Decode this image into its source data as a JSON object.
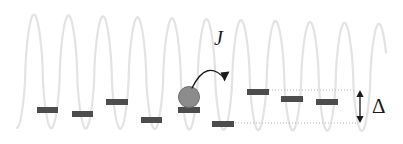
{
  "figure": {
    "background_color": "#ffffff",
    "width": 403,
    "height": 144
  },
  "annotations": {
    "coupling_label": "J",
    "offset_label": "Δ"
  },
  "colors": {
    "lattice_potential": "#e3e3e3",
    "energy_level": "#4d4d4d",
    "atom_fill": "#8c8c8c",
    "atom_stroke": "#6e6e6e",
    "guide_line": "#b5b5b5",
    "arrow": "#1a1a1a",
    "text": "#1a1a1a"
  },
  "chart_data": {
    "type": "line",
    "xlabel": "",
    "ylabel": "",
    "grid": false,
    "legend": null,
    "xlim": [
      0,
      403
    ],
    "ylim": [
      144,
      0
    ],
    "series": [
      {
        "name": "lattice potential",
        "type": "sinusoid",
        "color": "#e3e3e3",
        "stroke_width": 2.2,
        "amplitude_top_y": 14,
        "amplitude_bottom_y": 128,
        "period_px": 34.5,
        "first_peak_x": 34,
        "num_peaks": 10,
        "x_start": 17,
        "x_end": 386,
        "peak_x_values": [
          34,
          68.5,
          103,
          137.5,
          172,
          206.5,
          241,
          275.5,
          310,
          344.5
        ],
        "trough_x_values": [
          51.5,
          86,
          120.5,
          155,
          189.5,
          224,
          258.5,
          293,
          327.5,
          362
        ],
        "tilt_note": "potential envelope tilted slightly downward to the right"
      }
    ],
    "energy_levels": [
      {
        "site": 1,
        "x_left": 37,
        "x_right": 58,
        "y": 107,
        "width": 21,
        "height": 6
      },
      {
        "site": 2,
        "x_left": 72,
        "x_right": 93,
        "y": 111,
        "width": 21,
        "height": 6
      },
      {
        "site": 3,
        "x_left": 106,
        "x_right": 128,
        "y": 99,
        "width": 22,
        "height": 6
      },
      {
        "site": 4,
        "x_left": 141,
        "x_right": 162,
        "y": 117,
        "width": 21,
        "height": 6
      },
      {
        "site": 5,
        "x_left": 178,
        "x_right": 200,
        "y": 107,
        "width": 22,
        "height": 6,
        "occupied": true
      },
      {
        "site": 6,
        "x_left": 212,
        "x_right": 234,
        "y": 121,
        "width": 22,
        "height": 6
      },
      {
        "site": 7,
        "x_left": 247,
        "x_right": 269,
        "y": 89,
        "width": 22,
        "height": 6
      },
      {
        "site": 8,
        "x_left": 281,
        "x_right": 303,
        "y": 96,
        "width": 22,
        "height": 6
      },
      {
        "site": 9,
        "x_left": 316,
        "x_right": 338,
        "y": 99,
        "width": 22,
        "height": 6
      }
    ],
    "atom": {
      "center_x": 189,
      "center_y": 97,
      "radius": 10.5,
      "on_site": 5
    },
    "tunneling_arrow": {
      "label": "J",
      "from_x": 192,
      "from_y": 88,
      "to_x": 225,
      "to_y": 79,
      "apex_x": 207,
      "apex_y": 58,
      "direction": "right",
      "label_x": 221,
      "label_y": 40
    },
    "guide_lines": [
      {
        "name": "upper-level-guide",
        "y": 90,
        "x_start": 266,
        "x_end": 356,
        "style": "dotted"
      },
      {
        "name": "lower-level-guide",
        "y": 123,
        "x_start": 232,
        "x_end": 356,
        "style": "dotted"
      }
    ],
    "offset_measure": {
      "label": "Δ",
      "x": 360,
      "y_top": 90,
      "y_bottom": 123,
      "arrow_heads": "both",
      "label_x": 378,
      "label_y": 105
    }
  }
}
